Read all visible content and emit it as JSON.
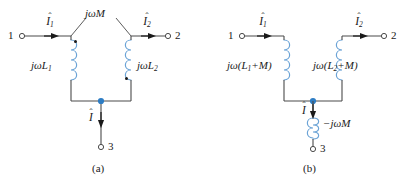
{
  "figure": {
    "background_color": "#ffffff",
    "wire_color": "#4a4a4a",
    "coil_color": "#6ba3d6",
    "node_color": "#2e7dc4",
    "text_color": "#1a1a1a"
  },
  "circuit_a": {
    "caption": "(a)",
    "terminals": [
      {
        "name": "terminal-1",
        "label": "1"
      },
      {
        "name": "terminal-2",
        "label": "2"
      },
      {
        "name": "terminal-3",
        "label": "3"
      }
    ],
    "currents": [
      {
        "name": "current-i1",
        "symbol": "I",
        "subscript": "1"
      },
      {
        "name": "current-i2",
        "symbol": "I",
        "subscript": "2"
      },
      {
        "name": "current-i",
        "symbol": "I",
        "subscript": ""
      }
    ],
    "components": [
      {
        "name": "mutual-inductance-label",
        "label": "jωM"
      },
      {
        "name": "inductor-l1-label",
        "label": "jωL",
        "subscript": "1"
      },
      {
        "name": "inductor-l2-label",
        "label": "jωL",
        "subscript": "2"
      }
    ],
    "polarity_dots": 2
  },
  "circuit_b": {
    "caption": "(b)",
    "terminals": [
      {
        "name": "terminal-1",
        "label": "1"
      },
      {
        "name": "terminal-2",
        "label": "2"
      },
      {
        "name": "terminal-3",
        "label": "3"
      }
    ],
    "currents": [
      {
        "name": "current-i1",
        "symbol": "I",
        "subscript": "1"
      },
      {
        "name": "current-i2",
        "symbol": "I",
        "subscript": "2"
      },
      {
        "name": "current-i",
        "symbol": "I",
        "subscript": ""
      }
    ],
    "components": [
      {
        "name": "inductor-left-label",
        "prefix": "jω(L",
        "subscript": "1",
        "suffix": "+M)"
      },
      {
        "name": "inductor-right-label",
        "prefix": "jω(L",
        "subscript": "2",
        "suffix": "+M)"
      },
      {
        "name": "inductor-bottom-label",
        "label": "−jωM"
      }
    ]
  }
}
